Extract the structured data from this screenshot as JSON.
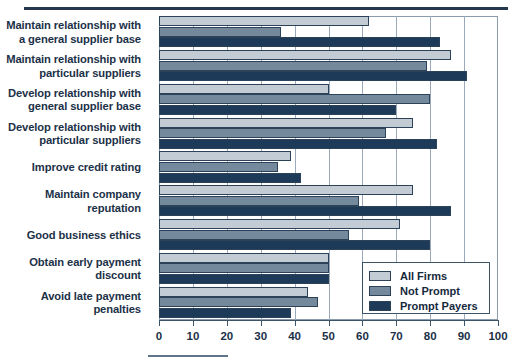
{
  "chart_data": {
    "type": "bar",
    "orientation": "horizontal",
    "title": "",
    "xlabel": "",
    "ylabel": "",
    "xlim": [
      0,
      100
    ],
    "xticks": [
      0,
      10,
      20,
      30,
      40,
      50,
      60,
      70,
      80,
      90,
      100
    ],
    "xtick_labels": [
      "0",
      "10",
      "20",
      "30",
      "40",
      "50",
      "60",
      "70",
      "80",
      "90",
      "100"
    ],
    "grid": true,
    "legend_position": "lower right",
    "categories": [
      "Maintain relationship with a general supplier base",
      "Maintain relationship with particular suppliers",
      "Develop relationship with general supplier base",
      "Develop relationship with particular suppliers",
      "Improve credit rating",
      "Maintain company reputation",
      "Good business ethics",
      "Obtain early payment discount",
      "Avoid late payment penalties"
    ],
    "category_lines": [
      [
        "Maintain relationship with",
        "a general supplier base"
      ],
      [
        "Maintain relationship with",
        "particular suppliers"
      ],
      [
        "Develop relationship with",
        "general supplier base"
      ],
      [
        "Develop relationship with",
        "particular suppliers"
      ],
      [
        "Improve credit rating"
      ],
      [
        "Maintain company",
        "reputation"
      ],
      [
        "Good business ethics"
      ],
      [
        "Obtain early payment",
        "discount"
      ],
      [
        "Avoid late payment",
        "penalties"
      ]
    ],
    "series": [
      {
        "name": "All Firms",
        "color": "#c3ccd4",
        "values": [
          62,
          86,
          50,
          75,
          39,
          75,
          71,
          50,
          44
        ]
      },
      {
        "name": "Not Prompt",
        "color": "#748a9c",
        "values": [
          36,
          79,
          80,
          67,
          35,
          59,
          56,
          50,
          47
        ]
      },
      {
        "name": "Prompt Payers",
        "color": "#1d3a59",
        "values": [
          83,
          91,
          70,
          82,
          42,
          86,
          80,
          50,
          39
        ]
      }
    ]
  },
  "legend": {
    "entries": [
      {
        "label": "All Firms",
        "swatch": "all"
      },
      {
        "label": "Not Prompt",
        "swatch": "notp"
      },
      {
        "label": "Prompt Payers",
        "swatch": "prompt"
      }
    ]
  }
}
